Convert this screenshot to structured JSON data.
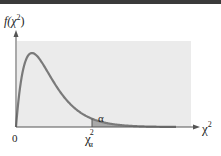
{
  "chart_data": {
    "type": "area",
    "title": "",
    "distribution": "chi-square",
    "degrees_of_freedom": 4,
    "ylabel": "f(χ²)",
    "xlabel": "χ²",
    "x_tick_labels": [
      "0",
      "χ²α"
    ],
    "critical_value_label": "χ²α",
    "shaded_region_label": "α",
    "shaded_region": "right tail beyond critical value",
    "xlim": [
      0,
      20
    ],
    "critical_value": 9.5,
    "grid": false,
    "legend": "none"
  },
  "labels": {
    "y_axis": "f(χ",
    "y_axis_sup": "2",
    "y_axis_close": ")",
    "x_axis": "χ",
    "x_axis_sup": "2",
    "origin": "0",
    "crit": "χ",
    "crit_sup": "2",
    "crit_sub": "α",
    "alpha": "α"
  },
  "colors": {
    "curve": "#7a7a7a",
    "shade": "#a9a9a9",
    "panel": "#ebebeb",
    "axis": "#555555",
    "rule": "#3a3a3a"
  }
}
